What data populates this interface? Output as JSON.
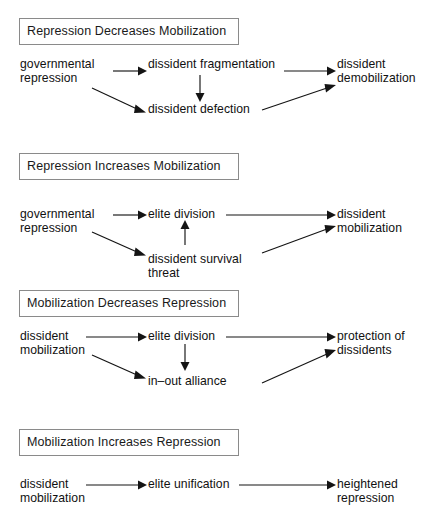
{
  "figure": {
    "name": "repression-mobilization-causal-diagrams",
    "background_color": "#ffffff",
    "line_color": "#141414",
    "box_border_color": "#8a8a8a",
    "text_color": "#111111"
  },
  "panels": [
    {
      "id": "panel-1",
      "title": "Repression Decreases Mobilization",
      "nodes": [
        {
          "id": "p1-n1",
          "label": "governmental\nrepression"
        },
        {
          "id": "p1-n2",
          "label": "dissident fragmentation"
        },
        {
          "id": "p1-n3",
          "label": "dissident defection"
        },
        {
          "id": "p1-n4",
          "label": "dissident\ndemobilization"
        }
      ],
      "edges": [
        {
          "from": "governmental repression",
          "to": "dissident fragmentation"
        },
        {
          "from": "governmental repression",
          "to": "dissident defection"
        },
        {
          "from": "dissident fragmentation",
          "to": "dissident defection"
        },
        {
          "from": "dissident fragmentation",
          "to": "dissident demobilization"
        },
        {
          "from": "dissident defection",
          "to": "dissident demobilization"
        }
      ]
    },
    {
      "id": "panel-2",
      "title": "Repression Increases Mobilization",
      "nodes": [
        {
          "id": "p2-n1",
          "label": "governmental\nrepression"
        },
        {
          "id": "p2-n2",
          "label": "elite division"
        },
        {
          "id": "p2-n3",
          "label": "dissident survival\nthreat"
        },
        {
          "id": "p2-n4",
          "label": "dissident\nmobilization"
        }
      ],
      "edges": [
        {
          "from": "governmental repression",
          "to": "elite division"
        },
        {
          "from": "governmental repression",
          "to": "dissident survival threat"
        },
        {
          "from": "dissident survival threat",
          "to": "elite division"
        },
        {
          "from": "elite division",
          "to": "dissident mobilization"
        },
        {
          "from": "dissident survival threat",
          "to": "dissident mobilization"
        }
      ]
    },
    {
      "id": "panel-3",
      "title": "Mobilization Decreases Repression",
      "nodes": [
        {
          "id": "p3-n1",
          "label": "dissident\nmobilization"
        },
        {
          "id": "p3-n2",
          "label": "elite division"
        },
        {
          "id": "p3-n3",
          "label": "in–out alliance"
        },
        {
          "id": "p3-n4",
          "label": "protection of\ndissidents"
        }
      ],
      "edges": [
        {
          "from": "dissident mobilization",
          "to": "elite division"
        },
        {
          "from": "dissident mobilization",
          "to": "in–out alliance"
        },
        {
          "from": "elite division",
          "to": "in–out alliance"
        },
        {
          "from": "elite division",
          "to": "protection of dissidents"
        },
        {
          "from": "in–out alliance",
          "to": "protection of dissidents"
        }
      ]
    },
    {
      "id": "panel-4",
      "title": "Mobilization Increases Repression",
      "nodes": [
        {
          "id": "p4-n1",
          "label": "dissident\nmobilization"
        },
        {
          "id": "p4-n2",
          "label": "elite unification"
        },
        {
          "id": "p4-n3",
          "label": "heightened\nrepression"
        }
      ],
      "edges": [
        {
          "from": "dissident mobilization",
          "to": "elite unification"
        },
        {
          "from": "elite unification",
          "to": "heightened repression"
        }
      ]
    }
  ]
}
